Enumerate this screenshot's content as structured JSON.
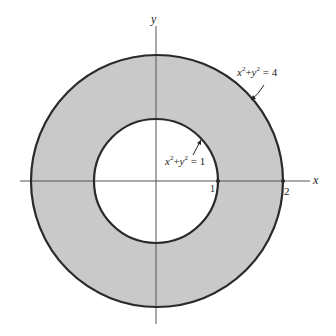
{
  "diagram": {
    "axes": {
      "x_label": "x",
      "y_label": "y"
    },
    "tick_labels": {
      "inner_x": "1",
      "outer_x": "2"
    },
    "inner_circle": {
      "equation_lhs_x": "x",
      "equation_lhs_y": "y",
      "exponent": "2",
      "plus": "+",
      "equals": "= 1",
      "radius": 1
    },
    "outer_circle": {
      "equation_lhs_x": "x",
      "equation_lhs_y": "y",
      "exponent": "2",
      "plus": "+",
      "equals": "= 4",
      "radius": 2
    },
    "colors": {
      "annulus_fill": "#c9c9c9",
      "circle_stroke": "#2a2a2a",
      "axis_stroke": "#555555",
      "background": "#ffffff"
    }
  }
}
